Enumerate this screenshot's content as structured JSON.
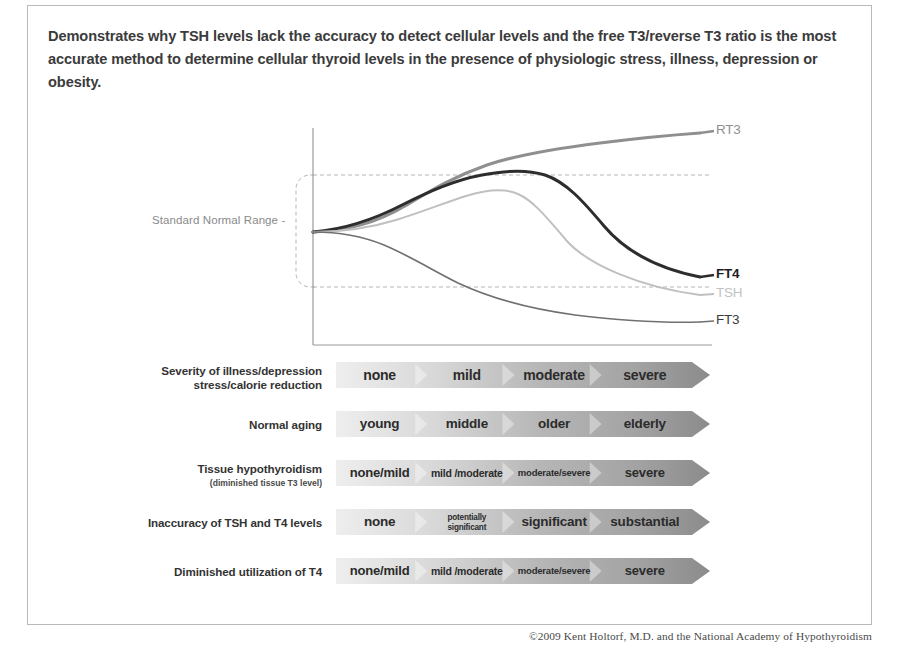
{
  "intro": {
    "text": "Demonstrates why TSH levels lack the accuracy to detect cellular levels and the free T3/reverse T3 ratio is the most accurate method to determine cellular thyroid levels in the presence of physiologic stress, illness, depression or obesity."
  },
  "chart": {
    "normal_range_label": "Standard Normal Range -",
    "curve_labels": {
      "rt3": "RT3",
      "ft4": "FT4",
      "tsh": "TSH",
      "ft3": "FT3"
    },
    "colors": {
      "rt3": "#8f8f8f",
      "ft4": "#2d2d2d",
      "tsh": "#c0c0c0",
      "ft3": "#707070",
      "axis": "#9a9a9a",
      "dashed": "#b5b5b5"
    }
  },
  "chart_data": {
    "type": "line",
    "title": "",
    "xlabel": "Severity of illness / depression / stress / calorie reduction  →",
    "ylabel": "Hormone level",
    "xlim": [
      0,
      100
    ],
    "ylim": [
      0,
      100
    ],
    "grid": "two horizontal dashed lines bounding the Standard Normal Range",
    "annotations": [
      "Standard Normal Range -"
    ],
    "legend_position": "right end of each curve",
    "series": [
      {
        "name": "RT3",
        "color": "#8f8f8f",
        "x": [
          0,
          12,
          25,
          38,
          50,
          62,
          75,
          88,
          100
        ],
        "values": [
          50,
          52,
          58,
          68,
          77,
          84,
          89,
          94,
          99
        ]
      },
      {
        "name": "FT4",
        "color": "#2d2d2d",
        "x": [
          0,
          12,
          25,
          38,
          50,
          62,
          75,
          88,
          100
        ],
        "values": [
          50,
          53,
          60,
          68,
          73,
          74,
          68,
          52,
          34
        ]
      },
      {
        "name": "TSH",
        "color": "#c0c0c0",
        "x": [
          0,
          12,
          25,
          38,
          50,
          62,
          75,
          88,
          100
        ],
        "values": [
          50,
          50,
          54,
          60,
          64,
          62,
          52,
          38,
          27
        ]
      },
      {
        "name": "FT3",
        "color": "#707070",
        "x": [
          0,
          12,
          25,
          38,
          50,
          62,
          75,
          88,
          100
        ],
        "values": [
          50,
          50,
          47,
          42,
          36,
          30,
          25,
          20,
          16
        ]
      }
    ]
  },
  "rows": [
    {
      "label": "Severity of illness/depression",
      "label2": "stress/calorie reduction",
      "sub": "",
      "segments": [
        {
          "text": "none",
          "size": 14
        },
        {
          "text": "mild",
          "size": 14
        },
        {
          "text": "moderate",
          "size": 14
        },
        {
          "text": "severe",
          "size": 14
        }
      ]
    },
    {
      "label": "Normal aging",
      "label2": "",
      "sub": "",
      "segments": [
        {
          "text": "young",
          "size": 13.5
        },
        {
          "text": "middle",
          "size": 13.5
        },
        {
          "text": "older",
          "size": 13.5
        },
        {
          "text": "elderly",
          "size": 13.5
        }
      ]
    },
    {
      "label": "Tissue hypothyroidism",
      "label2": "",
      "sub": "(diminished tissue T3 level)",
      "segments": [
        {
          "text": "none/mild",
          "size": 13
        },
        {
          "text": "mild /moderate",
          "size": 10.5
        },
        {
          "text": "moderate/severe",
          "size": 9.5
        },
        {
          "text": "severe",
          "size": 13
        }
      ]
    },
    {
      "label": "Inaccuracy of TSH and T4 levels",
      "label2": "",
      "sub": "",
      "segments": [
        {
          "text": "none",
          "size": 13.5
        },
        {
          "text": "potentially|significant",
          "size": 8.2
        },
        {
          "text": "significant",
          "size": 13.5
        },
        {
          "text": "substantial",
          "size": 13.5
        }
      ]
    },
    {
      "label": "Diminished utilization of T4",
      "label2": "",
      "sub": "",
      "segments": [
        {
          "text": "none/mild",
          "size": 13
        },
        {
          "text": "mild /moderate",
          "size": 10.5
        },
        {
          "text": "moderate/severe",
          "size": 9.5
        },
        {
          "text": "severe",
          "size": 13
        }
      ]
    }
  ],
  "bar_colors": {
    "start": "#eeeeee",
    "mid1": "#d8d8d8",
    "mid2": "#b6b6b6",
    "end": "#8b8b8b"
  },
  "copyright": "©2009 Kent Holtorf, M.D. and the National Academy of Hypothyroidism"
}
